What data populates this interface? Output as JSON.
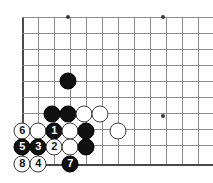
{
  "figure": {
    "kind": "go-board-diagram",
    "board": {
      "line_color": "#8b8b8b",
      "edge_color": "#4a4a4a",
      "background": "#ffffff",
      "star_color": "#3a3a3a",
      "vertical_lines_x": [
        22,
        38,
        54,
        70,
        86,
        102,
        118,
        134,
        150,
        166,
        182,
        198
      ],
      "horizontal_lines_y": [
        17,
        33,
        49,
        65,
        81,
        97,
        113,
        129,
        145,
        164
      ],
      "left_edge_x": 22,
      "bottom_edge_y": 164,
      "star_points": [
        {
          "x": 68,
          "y": 17
        },
        {
          "x": 163,
          "y": 17
        },
        {
          "x": 163,
          "y": 116
        }
      ]
    },
    "stones": [
      {
        "id": "b-a",
        "color": "black",
        "x": 68,
        "y": 81,
        "label": ""
      },
      {
        "id": "b-b",
        "color": "black",
        "x": 52,
        "y": 114,
        "label": ""
      },
      {
        "id": "b-c",
        "color": "black",
        "x": 68,
        "y": 114,
        "label": ""
      },
      {
        "id": "w-a",
        "color": "white",
        "x": 84,
        "y": 114,
        "label": ""
      },
      {
        "id": "w-b",
        "color": "white",
        "x": 100,
        "y": 114,
        "label": ""
      },
      {
        "id": "move-6",
        "color": "white",
        "x": 22,
        "y": 131,
        "label": "6"
      },
      {
        "id": "w-c",
        "color": "white",
        "x": 38,
        "y": 131,
        "label": ""
      },
      {
        "id": "move-1",
        "color": "black",
        "x": 54,
        "y": 131,
        "label": "1"
      },
      {
        "id": "w-d",
        "color": "white",
        "x": 70,
        "y": 131,
        "label": ""
      },
      {
        "id": "b-d",
        "color": "black",
        "x": 86,
        "y": 131,
        "label": ""
      },
      {
        "id": "w-e",
        "color": "white",
        "x": 118,
        "y": 131,
        "label": ""
      },
      {
        "id": "move-5",
        "color": "black",
        "x": 22,
        "y": 147,
        "label": "5"
      },
      {
        "id": "move-3",
        "color": "black",
        "x": 38,
        "y": 147,
        "label": "3"
      },
      {
        "id": "move-2",
        "color": "white",
        "x": 54,
        "y": 147,
        "label": "2"
      },
      {
        "id": "w-f",
        "color": "white",
        "x": 70,
        "y": 147,
        "label": ""
      },
      {
        "id": "b-e",
        "color": "black",
        "x": 86,
        "y": 147,
        "label": ""
      },
      {
        "id": "move-8",
        "color": "white",
        "x": 22,
        "y": 164,
        "label": "8"
      },
      {
        "id": "move-4",
        "color": "white",
        "x": 38,
        "y": 164,
        "label": "4"
      },
      {
        "id": "move-7",
        "color": "black",
        "x": 70,
        "y": 164,
        "label": "7"
      }
    ]
  }
}
